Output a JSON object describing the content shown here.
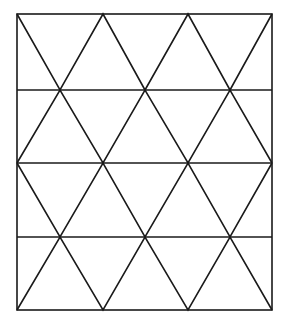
{
  "diagram": {
    "title": "",
    "stroke_color": "#1a1a1a",
    "background": "#ffffff",
    "frame": {
      "x1": 17,
      "y1": 14,
      "x2": 272,
      "y2": 310
    },
    "row_y": [
      14,
      90,
      163,
      237,
      310
    ],
    "rows": 4
  }
}
